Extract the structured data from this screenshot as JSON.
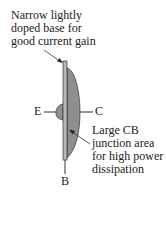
{
  "diagram": {
    "title_callout": {
      "lines": [
        "Narrow lightly",
        "doped base for",
        "good current gain"
      ]
    },
    "bottom_callout": {
      "lines": [
        "Large CB",
        "junction area",
        "for high power",
        "dissipation"
      ]
    },
    "terminals": {
      "emitter": "E",
      "collector": "C",
      "base": "B"
    },
    "colors": {
      "collector_fill": "#8f8f8f",
      "base_fill": "#b8b8b8",
      "outline": "#333333"
    }
  }
}
